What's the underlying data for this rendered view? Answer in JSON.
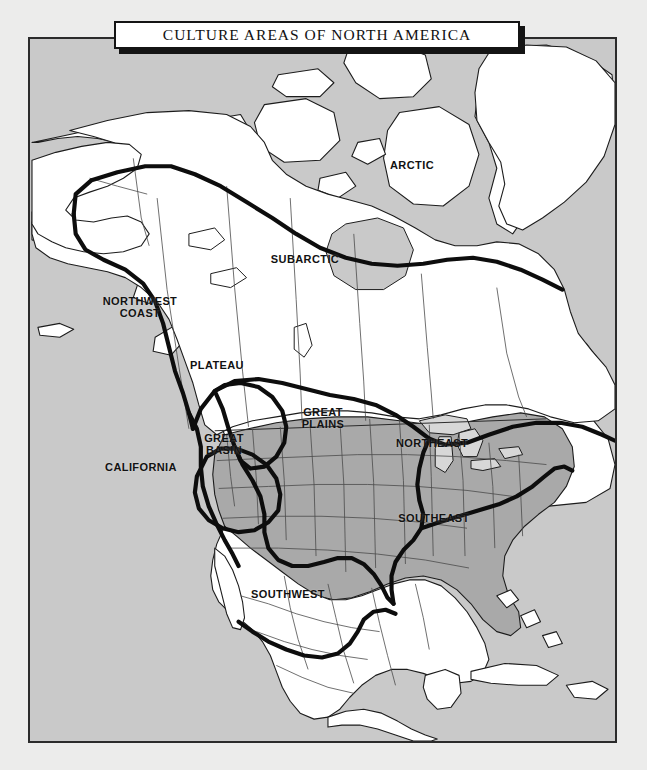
{
  "title": {
    "text": "CULTURE AREAS OF NORTH AMERICA"
  },
  "map": {
    "name": "north-america-culture-areas-map",
    "colors": {
      "page_background": "#ececeb",
      "ocean": "#c9c9c9",
      "land_unshaded": "#ffffff",
      "land_shaded": "#a9a9a9",
      "great_lakes": "#d7d7d7",
      "frame_border": "#2b2b2b",
      "boundary_line": "#101010",
      "political_line": "#3a3a3a",
      "label_text": "#121212"
    },
    "labels": [
      {
        "id": "arctic",
        "text": "ARCTIC",
        "x": 410,
        "y": 163
      },
      {
        "id": "subarctic",
        "text": "SUBARCTIC",
        "x": 303,
        "y": 257
      },
      {
        "id": "northwest-coast",
        "text": "NORTHWEST\nCOAST",
        "x": 138,
        "y": 305
      },
      {
        "id": "plateau",
        "text": "PLATEAU",
        "x": 215,
        "y": 363
      },
      {
        "id": "great-plains",
        "text": "GREAT\nPLAINS",
        "x": 321,
        "y": 416
      },
      {
        "id": "great-basin",
        "text": "GREAT\nBASIN",
        "x": 222,
        "y": 442
      },
      {
        "id": "northeast",
        "text": "NORTHEAST",
        "x": 430,
        "y": 441
      },
      {
        "id": "california",
        "text": "CALIFORNIA",
        "x": 139,
        "y": 465
      },
      {
        "id": "southeast",
        "text": "SOUTHEAST",
        "x": 432,
        "y": 516
      },
      {
        "id": "southwest",
        "text": "SOUTHWEST",
        "x": 286,
        "y": 592
      }
    ]
  },
  "caption": {
    "text": ""
  }
}
